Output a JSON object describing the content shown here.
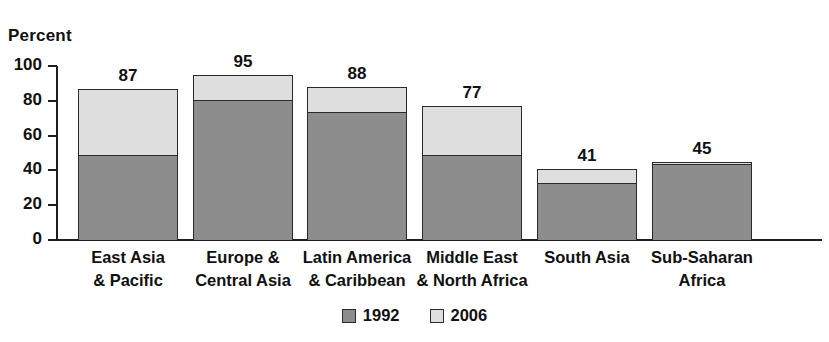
{
  "chart_data": {
    "type": "bar",
    "subtype": "stacked-bar",
    "title": "",
    "xlabel": "",
    "ylabel": "Percent",
    "ylim": [
      0,
      100
    ],
    "yticks": [
      0,
      20,
      40,
      60,
      80,
      100
    ],
    "grid": false,
    "legend_position": "bottom-center",
    "categories": [
      "East Asia\n& Pacific",
      "Europe &\nCentral Asia",
      "Latin America\n& Caribbean",
      "Middle East\n& North Africa",
      "South Asia",
      "Sub-Saharan\nAfrica"
    ],
    "series": [
      {
        "name": "1992",
        "color": "#8d8d8d",
        "values": [
          48,
          80,
          73,
          48,
          32,
          43
        ]
      },
      {
        "name": "2006",
        "color": "#dedede",
        "values": [
          39,
          15,
          15,
          29,
          9,
          2
        ]
      }
    ],
    "totals": [
      87,
      95,
      88,
      77,
      41,
      45
    ],
    "data_labels": [
      "87",
      "95",
      "88",
      "77",
      "41",
      "45"
    ]
  },
  "axis": {
    "y_title": "Percent",
    "tick_labels": [
      "100",
      "80",
      "60",
      "40",
      "20",
      "0"
    ]
  },
  "categories": [
    {
      "line1": "East Asia",
      "line2": "& Pacific"
    },
    {
      "line1": "Europe &",
      "line2": "Central Asia"
    },
    {
      "line1": "Latin America",
      "line2": "& Caribbean"
    },
    {
      "line1": "Middle East",
      "line2": "& North Africa"
    },
    {
      "line1": "South Asia",
      "line2": ""
    },
    {
      "line1": "Sub-Saharan",
      "line2": "Africa"
    }
  ],
  "legend": {
    "items": [
      {
        "label": "1992",
        "color": "#8d8d8d"
      },
      {
        "label": "2006",
        "color": "#dedede"
      }
    ]
  },
  "colors": {
    "series_1992": "#8d8d8d",
    "series_2006": "#dedede",
    "axis": "#1d1d1d",
    "outline": "#2a2a2a",
    "background": "#ffffff",
    "text": "#111111"
  }
}
